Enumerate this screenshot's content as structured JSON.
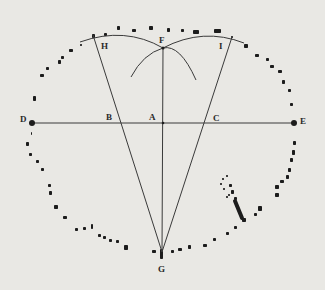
{
  "figure": {
    "type": "geometric-construction-over-stone-circle",
    "ink_color": "#1c1c1c",
    "line_color": "#3a3a3a",
    "background": "#e9e8e4"
  },
  "points": {
    "A": {
      "label": "A",
      "x": 163,
      "y": 123,
      "lx": 149,
      "ly": 120
    },
    "B": {
      "label": "B",
      "x": 120,
      "y": 123,
      "lx": 106,
      "ly": 120
    },
    "C": {
      "label": "C",
      "x": 204,
      "y": 123,
      "lx": 213,
      "ly": 121
    },
    "D": {
      "label": "D",
      "x": 32,
      "y": 123,
      "lx": 20,
      "ly": 122
    },
    "E": {
      "label": "E",
      "x": 294,
      "y": 123,
      "lx": 300,
      "ly": 124
    },
    "F": {
      "label": "F",
      "x": 163,
      "y": 48,
      "lx": 159,
      "ly": 43
    },
    "G": {
      "label": "G",
      "x": 162,
      "y": 252,
      "lx": 158,
      "ly": 272
    },
    "H": {
      "label": "H",
      "x": 93,
      "y": 35,
      "lx": 101,
      "ly": 49
    },
    "I": {
      "label": "I",
      "x": 232,
      "y": 37,
      "lx": 219,
      "ly": 49
    }
  },
  "lines": [
    {
      "name": "line-DE",
      "from": "D",
      "to": "E"
    },
    {
      "name": "line-FG",
      "from": "F",
      "to": "G"
    },
    {
      "name": "line-HG",
      "from": "H",
      "to": "G"
    },
    {
      "name": "line-IG",
      "from": "I",
      "to": "G"
    }
  ],
  "arcs": [
    {
      "name": "arc-left-top",
      "d": "M 82 40 Q 128 28 163 48"
    },
    {
      "name": "arc-right-top",
      "d": "M 163 48 Q 200 28 242 42"
    },
    {
      "name": "arc-left-cross",
      "d": "M 130 77 Q 142 57 163 48 Q 184 38 196 80"
    },
    {
      "name": "arc-right-cross",
      "d": "M 196 80"
    }
  ],
  "stones": [
    {
      "x": 92,
      "y": 34,
      "w": 3,
      "h": 4
    },
    {
      "x": 104,
      "y": 33,
      "w": 3,
      "h": 3
    },
    {
      "x": 117,
      "y": 26,
      "w": 3,
      "h": 4
    },
    {
      "x": 132,
      "y": 29,
      "w": 4,
      "h": 3
    },
    {
      "x": 149,
      "y": 26,
      "w": 4,
      "h": 4
    },
    {
      "x": 167,
      "y": 28,
      "w": 3,
      "h": 4
    },
    {
      "x": 181,
      "y": 29,
      "w": 3,
      "h": 3
    },
    {
      "x": 193,
      "y": 30,
      "w": 6,
      "h": 4
    },
    {
      "x": 214,
      "y": 29,
      "w": 7,
      "h": 4
    },
    {
      "x": 231,
      "y": 36,
      "w": 2,
      "h": 2
    },
    {
      "x": 244,
      "y": 44,
      "w": 4,
      "h": 4
    },
    {
      "x": 255,
      "y": 54,
      "w": 4,
      "h": 3
    },
    {
      "x": 266,
      "y": 58,
      "w": 3,
      "h": 3
    },
    {
      "x": 270,
      "y": 65,
      "w": 4,
      "h": 3
    },
    {
      "x": 278,
      "y": 70,
      "w": 4,
      "h": 3
    },
    {
      "x": 282,
      "y": 80,
      "w": 3,
      "h": 4
    },
    {
      "x": 288,
      "y": 89,
      "w": 3,
      "h": 3
    },
    {
      "x": 290,
      "y": 103,
      "w": 3,
      "h": 3
    },
    {
      "x": 293,
      "y": 141,
      "w": 3,
      "h": 4
    },
    {
      "x": 292,
      "y": 150,
      "w": 3,
      "h": 5
    },
    {
      "x": 290,
      "y": 158,
      "w": 3,
      "h": 4
    },
    {
      "x": 288,
      "y": 168,
      "w": 3,
      "h": 4
    },
    {
      "x": 286,
      "y": 175,
      "w": 3,
      "h": 4
    },
    {
      "x": 280,
      "y": 180,
      "w": 4,
      "h": 3
    },
    {
      "x": 275,
      "y": 185,
      "w": 4,
      "h": 4
    },
    {
      "x": 275,
      "y": 193,
      "w": 4,
      "h": 4
    },
    {
      "x": 258,
      "y": 206,
      "w": 4,
      "h": 5
    },
    {
      "x": 254,
      "y": 213,
      "w": 3,
      "h": 3
    },
    {
      "x": 242,
      "y": 218,
      "w": 4,
      "h": 4
    },
    {
      "x": 234,
      "y": 226,
      "w": 3,
      "h": 3
    },
    {
      "x": 226,
      "y": 232,
      "w": 3,
      "h": 3
    },
    {
      "x": 213,
      "y": 238,
      "w": 3,
      "h": 3
    },
    {
      "x": 203,
      "y": 244,
      "w": 4,
      "h": 3
    },
    {
      "x": 188,
      "y": 245,
      "w": 3,
      "h": 4
    },
    {
      "x": 178,
      "y": 248,
      "w": 4,
      "h": 3
    },
    {
      "x": 171,
      "y": 250,
      "w": 3,
      "h": 3
    },
    {
      "x": 152,
      "y": 250,
      "w": 4,
      "h": 3
    },
    {
      "x": 160,
      "y": 249,
      "w": 3,
      "h": 10
    },
    {
      "x": 124,
      "y": 245,
      "w": 4,
      "h": 5
    },
    {
      "x": 116,
      "y": 240,
      "w": 3,
      "h": 3
    },
    {
      "x": 109,
      "y": 239,
      "w": 3,
      "h": 3
    },
    {
      "x": 103,
      "y": 236,
      "w": 3,
      "h": 3
    },
    {
      "x": 98,
      "y": 234,
      "w": 3,
      "h": 3
    },
    {
      "x": 91,
      "y": 224,
      "w": 2,
      "h": 5
    },
    {
      "x": 83,
      "y": 227,
      "w": 3,
      "h": 3
    },
    {
      "x": 75,
      "y": 228,
      "w": 3,
      "h": 3
    },
    {
      "x": 63,
      "y": 216,
      "w": 4,
      "h": 3
    },
    {
      "x": 54,
      "y": 205,
      "w": 4,
      "h": 4
    },
    {
      "x": 49,
      "y": 191,
      "w": 3,
      "h": 4
    },
    {
      "x": 48,
      "y": 184,
      "w": 3,
      "h": 3
    },
    {
      "x": 41,
      "y": 168,
      "w": 3,
      "h": 3
    },
    {
      "x": 36,
      "y": 160,
      "w": 3,
      "h": 3
    },
    {
      "x": 29,
      "y": 153,
      "w": 3,
      "h": 3
    },
    {
      "x": 26,
      "y": 142,
      "w": 3,
      "h": 4
    },
    {
      "x": 31,
      "y": 132,
      "w": 1,
      "h": 3
    },
    {
      "x": 33,
      "y": 96,
      "w": 3,
      "h": 5
    },
    {
      "x": 40,
      "y": 74,
      "w": 4,
      "h": 3
    },
    {
      "x": 46,
      "y": 67,
      "w": 3,
      "h": 3
    },
    {
      "x": 58,
      "y": 60,
      "w": 3,
      "h": 4
    },
    {
      "x": 61,
      "y": 56,
      "w": 3,
      "h": 3
    },
    {
      "x": 69,
      "y": 49,
      "w": 4,
      "h": 3
    },
    {
      "x": 80,
      "y": 44,
      "w": 2,
      "h": 2
    }
  ],
  "inner_stones": [
    {
      "x": 222,
      "y": 178,
      "w": 2,
      "h": 2
    },
    {
      "x": 226,
      "y": 175,
      "w": 2,
      "h": 2
    },
    {
      "x": 220,
      "y": 183,
      "w": 2,
      "h": 2
    },
    {
      "x": 229,
      "y": 184,
      "w": 3,
      "h": 3
    },
    {
      "x": 231,
      "y": 190,
      "w": 3,
      "h": 4
    },
    {
      "x": 228,
      "y": 194,
      "w": 2,
      "h": 2
    },
    {
      "x": 234,
      "y": 197,
      "w": 3,
      "h": 3
    },
    {
      "x": 223,
      "y": 188,
      "w": 2,
      "h": 2
    },
    {
      "x": 226,
      "y": 196,
      "w": 2,
      "h": 2
    }
  ],
  "long_stone": {
    "x1": 235,
    "y1": 201,
    "x2": 242,
    "y2": 218
  }
}
